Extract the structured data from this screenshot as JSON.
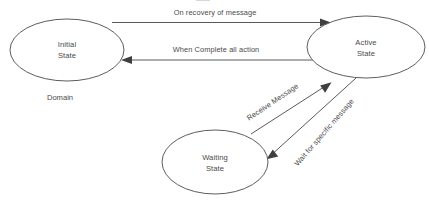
{
  "diagram": {
    "background_color": "#ffffff",
    "line_color": "#5a5a5a",
    "text_color": "#4a4a4a",
    "states": [
      {
        "id": "initial",
        "name": "Initial State",
        "label_line1": "Initial",
        "label_line2": "State",
        "cx": 67,
        "cy": 50,
        "rx": 57,
        "ry": 31
      },
      {
        "id": "active",
        "name": "Active State",
        "label_line1": "Active",
        "label_line2": "State",
        "cx": 366,
        "cy": 47,
        "rx": 59,
        "ry": 31
      },
      {
        "id": "waiting",
        "name": "Waiting State",
        "label_line1": "Waiting",
        "label_line2": "State",
        "cx": 215,
        "cy": 162,
        "rx": 53,
        "ry": 32
      }
    ],
    "transitions": [
      {
        "id": "initial-to-active",
        "label": "On recovery of message",
        "from": "initial",
        "to": "active",
        "label_x": 215,
        "label_y": 15,
        "rotation": 0
      },
      {
        "id": "active-to-initial",
        "label": "When Complete all action",
        "from": "active",
        "to": "initial",
        "label_x": 216,
        "label_y": 52,
        "rotation": 0
      },
      {
        "id": "waiting-to-active",
        "label": "Receive Message",
        "from": "waiting",
        "to": "active",
        "label_x": 274,
        "label_y": 104,
        "rotation": -34
      },
      {
        "id": "active-to-waiting",
        "label": "Wait for specific message",
        "from": "active",
        "to": "waiting",
        "label_x": 326,
        "label_y": 134,
        "rotation": -49
      }
    ],
    "captions": [
      {
        "id": "domain",
        "text": "Domain",
        "x": 60,
        "y": 100
      }
    ]
  }
}
